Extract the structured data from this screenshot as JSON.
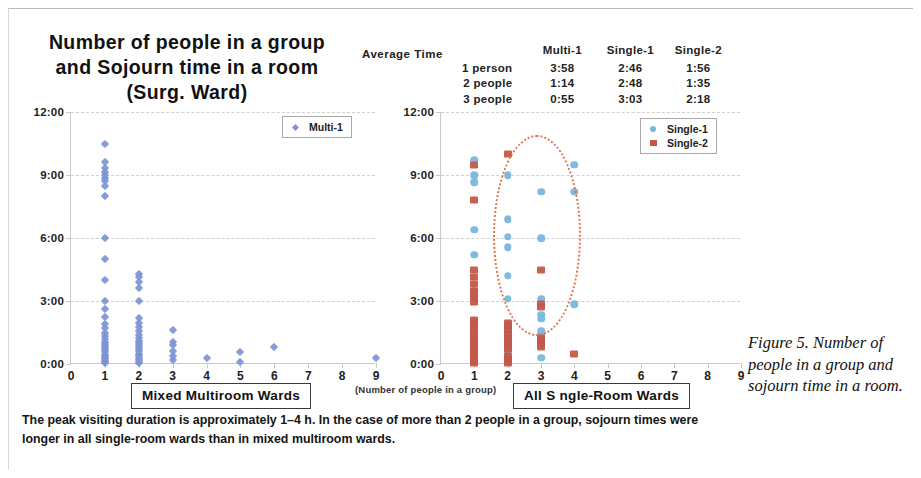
{
  "title": {
    "line1": "Number of people in a group",
    "line2": "and Sojourn time in a room",
    "line3": "(Surg. Ward)"
  },
  "average_time": {
    "label": "Average Time",
    "columns": [
      "Multi-1",
      "Single-1",
      "Single-2"
    ],
    "rows": [
      {
        "name": "1 person",
        "values": [
          "3:58",
          "2:46",
          "1:56"
        ]
      },
      {
        "name": "2 people",
        "values": [
          "1:14",
          "2:48",
          "1:35"
        ]
      },
      {
        "name": "3 people",
        "values": [
          "0:55",
          "3:03",
          "2:18"
        ]
      }
    ]
  },
  "left_chart_box": "Mixed Multiroom Wards",
  "right_chart_box": "All S ngle-Room Wards",
  "x_axis_note": "(Number of people in a group)",
  "caption": "The peak visiting duration is approximately 1–4 h. In the case of more than 2 people in a group, sojourn times were longer in all single-room wards than in mixed multiroom wards.",
  "figure_note": {
    "lead": "Figure 5.",
    "body": "Number of people in a group and sojourn time in a room."
  },
  "colors": {
    "multi1": "#7e95d4",
    "single1": "#79b7dd",
    "single2": "#c3584a",
    "ellipse": "#e2734c",
    "grid": "#cfcfcf",
    "axis": "#c9c9c9"
  },
  "chart_data": [
    {
      "type": "scatter",
      "title": "Mixed Multiroom Wards",
      "xlabel": "(Number of people in a group)",
      "ylabel": "",
      "xlim": [
        0,
        9
      ],
      "ylim": [
        0,
        12
      ],
      "xticks": [
        0,
        1,
        2,
        3,
        4,
        5,
        6,
        7,
        8,
        9
      ],
      "yticks": [
        0,
        3,
        6,
        9,
        12
      ],
      "ytick_labels": [
        "0:00",
        "3:00",
        "6:00",
        "9:00",
        "12:00"
      ],
      "grid": true,
      "legend_position": "top-right",
      "series": [
        {
          "name": "Multi-1",
          "color": "#7e95d4",
          "marker": "diamond",
          "points": [
            [
              1,
              10.5
            ],
            [
              1,
              9.6
            ],
            [
              1,
              9.35
            ],
            [
              1,
              9.15
            ],
            [
              1,
              9.0
            ],
            [
              1,
              8.85
            ],
            [
              1,
              8.7
            ],
            [
              1,
              8.5
            ],
            [
              1,
              8.0
            ],
            [
              1,
              6.0
            ],
            [
              1,
              5.0
            ],
            [
              1,
              4.0
            ],
            [
              1,
              3.0
            ],
            [
              1,
              2.6
            ],
            [
              1,
              2.25
            ],
            [
              1,
              1.9
            ],
            [
              1,
              1.7
            ],
            [
              1,
              1.5
            ],
            [
              1,
              1.35
            ],
            [
              1,
              1.2
            ],
            [
              1,
              1.05
            ],
            [
              1,
              0.95
            ],
            [
              1,
              0.85
            ],
            [
              1,
              0.75
            ],
            [
              1,
              0.65
            ],
            [
              1,
              0.55
            ],
            [
              1,
              0.45
            ],
            [
              1,
              0.38
            ],
            [
              1,
              0.3
            ],
            [
              1,
              0.22
            ],
            [
              1,
              0.15
            ],
            [
              1,
              0.1
            ],
            [
              1,
              0.05
            ],
            [
              2,
              4.3
            ],
            [
              2,
              4.15
            ],
            [
              2,
              3.9
            ],
            [
              2,
              3.6
            ],
            [
              2,
              3.0
            ],
            [
              2,
              2.2
            ],
            [
              2,
              1.95
            ],
            [
              2,
              1.75
            ],
            [
              2,
              1.55
            ],
            [
              2,
              1.4
            ],
            [
              2,
              1.25
            ],
            [
              2,
              1.1
            ],
            [
              2,
              1.0
            ],
            [
              2,
              0.9
            ],
            [
              2,
              0.8
            ],
            [
              2,
              0.7
            ],
            [
              2,
              0.6
            ],
            [
              2,
              0.5
            ],
            [
              2,
              0.42
            ],
            [
              2,
              0.34
            ],
            [
              2,
              0.26
            ],
            [
              2,
              0.18
            ],
            [
              2,
              0.1
            ],
            [
              2,
              0.05
            ],
            [
              3,
              1.6
            ],
            [
              3,
              1.05
            ],
            [
              3,
              0.9
            ],
            [
              3,
              0.6
            ],
            [
              3,
              0.4
            ],
            [
              3,
              0.2
            ],
            [
              4,
              0.3
            ],
            [
              5,
              0.55
            ],
            [
              5,
              0.1
            ],
            [
              6,
              0.8
            ],
            [
              9,
              0.3
            ]
          ]
        }
      ]
    },
    {
      "type": "scatter",
      "title": "All S ngle-Room Wards",
      "xlabel": "(Number of people in a group)",
      "ylabel": "",
      "xlim": [
        0,
        9
      ],
      "ylim": [
        0,
        12
      ],
      "xticks": [
        0,
        1,
        2,
        3,
        4,
        5,
        6,
        7,
        8,
        9
      ],
      "yticks": [
        0,
        3,
        6,
        9,
        12
      ],
      "ytick_labels": [
        "0:00",
        "3:00",
        "6:00",
        "9:00",
        "12:00"
      ],
      "grid": true,
      "legend_position": "top-right",
      "annotation": {
        "type": "ellipse",
        "style": "dotted",
        "color": "#e2734c",
        "center_x": 2.85,
        "center_y": 6.2,
        "width_x": 2.5,
        "height_y": 9.4
      },
      "series": [
        {
          "name": "Single-1",
          "color": "#79b7dd",
          "marker": "circle",
          "points": [
            [
              1,
              9.7
            ],
            [
              1,
              9.0
            ],
            [
              1,
              8.65
            ],
            [
              1,
              6.4
            ],
            [
              1,
              5.2
            ],
            [
              1,
              3.5
            ],
            [
              1,
              3.25
            ],
            [
              2,
              9.0
            ],
            [
              2,
              6.9
            ],
            [
              2,
              6.05
            ],
            [
              2,
              5.55
            ],
            [
              2,
              4.2
            ],
            [
              2,
              3.1
            ],
            [
              2,
              1.9
            ],
            [
              2,
              0.55
            ],
            [
              3,
              8.2
            ],
            [
              3,
              6.0
            ],
            [
              3,
              3.1
            ],
            [
              3,
              2.35
            ],
            [
              3,
              2.15
            ],
            [
              3,
              1.55
            ],
            [
              3,
              1.4
            ],
            [
              3,
              0.3
            ],
            [
              4,
              9.5
            ],
            [
              4,
              8.2
            ],
            [
              4,
              2.85
            ]
          ]
        },
        {
          "name": "Single-2",
          "color": "#c3584a",
          "marker": "square",
          "points": [
            [
              1,
              9.5
            ],
            [
              1,
              7.8
            ],
            [
              1,
              4.5
            ],
            [
              1,
              4.15
            ],
            [
              1,
              3.8
            ],
            [
              1,
              3.5
            ],
            [
              1,
              3.2
            ],
            [
              1,
              2.95
            ],
            [
              1,
              2.1
            ],
            [
              1,
              1.95
            ],
            [
              1,
              1.8
            ],
            [
              1,
              1.65
            ],
            [
              1,
              1.5
            ],
            [
              1,
              1.35
            ],
            [
              1,
              1.2
            ],
            [
              1,
              1.05
            ],
            [
              1,
              0.9
            ],
            [
              1,
              0.75
            ],
            [
              1,
              0.6
            ],
            [
              1,
              0.45
            ],
            [
              1,
              0.3
            ],
            [
              1,
              0.15
            ],
            [
              1,
              0.05
            ],
            [
              2,
              10.0
            ],
            [
              2,
              1.95
            ],
            [
              2,
              1.8
            ],
            [
              2,
              1.6
            ],
            [
              2,
              1.45
            ],
            [
              2,
              1.3
            ],
            [
              2,
              1.15
            ],
            [
              2,
              1.0
            ],
            [
              2,
              0.85
            ],
            [
              2,
              0.7
            ],
            [
              2,
              0.4
            ],
            [
              2,
              0.25
            ],
            [
              2,
              0.12
            ],
            [
              2,
              0.04
            ],
            [
              3,
              4.5
            ],
            [
              3,
              2.85
            ],
            [
              3,
              2.7
            ],
            [
              3,
              1.25
            ],
            [
              3,
              1.1
            ],
            [
              3,
              0.95
            ],
            [
              3,
              0.8
            ],
            [
              4,
              0.5
            ]
          ]
        }
      ]
    }
  ]
}
